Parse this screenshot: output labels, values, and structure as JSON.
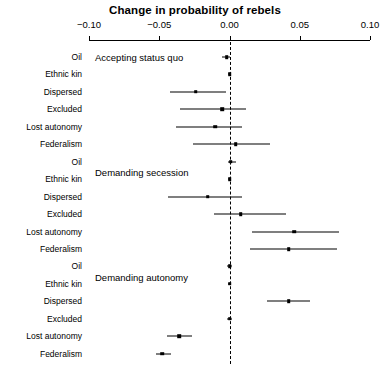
{
  "chart_data": {
    "type": "scatter",
    "title": "Change in probability of rebels",
    "xlabel": "",
    "ylabel": "",
    "xlim": [
      -0.1,
      0.1
    ],
    "xticks": [
      -0.1,
      -0.05,
      0.0,
      0.05,
      0.1
    ],
    "xticklabels": [
      "−0.10",
      "−0.05",
      "0.00",
      "0.05",
      "0.10"
    ],
    "grid": false,
    "legend": null,
    "reference_line": 0.0,
    "reference_line_style": "dashed",
    "groups": [
      {
        "label": "Accepting status quo",
        "points": [
          {
            "label": "Oil",
            "estimate": -0.002,
            "low": -0.005,
            "high": 0.0005
          },
          {
            "label": "Ethnic kin",
            "estimate": 0.0,
            "low": -0.001,
            "high": 0.001
          },
          {
            "label": "Dispersed",
            "estimate": -0.024,
            "low": -0.042,
            "high": -0.0025
          },
          {
            "label": "Excluded",
            "estimate": -0.005,
            "low": -0.035,
            "high": 0.0115
          },
          {
            "label": "Lost autonomy",
            "estimate": -0.01,
            "low": -0.038,
            "high": 0.009
          },
          {
            "label": "Federalism",
            "estimate": 0.0045,
            "low": -0.026,
            "high": 0.029
          }
        ]
      },
      {
        "label": "Demanding secession",
        "points": [
          {
            "label": "Oil",
            "estimate": 0.001,
            "low": -0.001,
            "high": 0.0045
          },
          {
            "label": "Ethnic kin",
            "estimate": 0.0,
            "low": -0.0012,
            "high": 0.0012
          },
          {
            "label": "Dispersed",
            "estimate": -0.0155,
            "low": -0.044,
            "high": 0.009
          },
          {
            "label": "Excluded",
            "estimate": 0.008,
            "low": -0.011,
            "high": 0.04
          },
          {
            "label": "Lost autonomy",
            "estimate": 0.046,
            "low": 0.016,
            "high": 0.078
          },
          {
            "label": "Federalism",
            "estimate": 0.042,
            "low": 0.0145,
            "high": 0.0765
          }
        ]
      },
      {
        "label": "Demanding autonomy",
        "points": [
          {
            "label": "Oil",
            "estimate": 0.0,
            "low": -0.0015,
            "high": 0.0015
          },
          {
            "label": "Ethnic kin",
            "estimate": 0.0,
            "low": -0.0012,
            "high": 0.0012
          },
          {
            "label": "Dispersed",
            "estimate": 0.042,
            "low": 0.027,
            "high": 0.0575
          },
          {
            "label": "Excluded",
            "estimate": 0.0,
            "low": -0.0015,
            "high": 0.0015
          },
          {
            "label": "Lost autonomy",
            "estimate": -0.036,
            "low": -0.0445,
            "high": -0.027
          },
          {
            "label": "Federalism",
            "estimate": -0.048,
            "low": -0.052,
            "high": -0.0415
          }
        ]
      }
    ]
  },
  "colors": {
    "foreground": "#000000",
    "background": "#ffffff"
  }
}
